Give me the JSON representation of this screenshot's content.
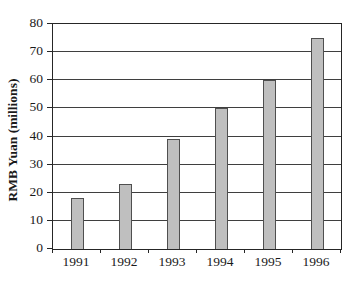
{
  "chart_data": {
    "type": "bar",
    "title": "",
    "categories": [
      "1991",
      "1992",
      "1993",
      "1994",
      "1995",
      "1996"
    ],
    "values": [
      18,
      23,
      39,
      50,
      60,
      75
    ],
    "xlabel": "",
    "ylabel": "RMB Yuan (millions)",
    "ylim": [
      0,
      80
    ],
    "yticks": [
      0,
      10,
      20,
      30,
      40,
      50,
      60,
      70,
      80
    ],
    "grid": "horizontal",
    "legend": "none",
    "colors": {
      "bar_fill": "#bfbfbf",
      "bar_border": "#4f4f4f",
      "gridline": "#3f3f3f",
      "axis": "#262626",
      "text": "#1a1a1a",
      "background": "#ffffff"
    }
  }
}
